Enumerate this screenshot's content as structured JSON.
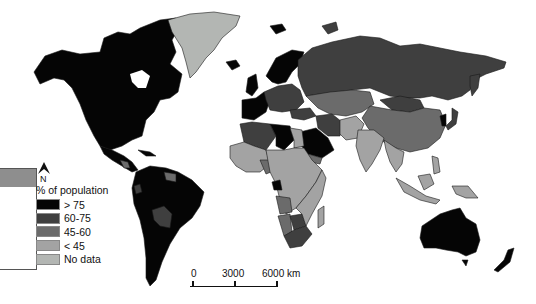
{
  "map": {
    "type": "world choropleth",
    "subject": "% of population"
  },
  "legend": {
    "title": "% of population",
    "items": [
      {
        "label": "> 75",
        "color": "#050505"
      },
      {
        "label": "60-75",
        "color": "#3f3f3f"
      },
      {
        "label": "45-60",
        "color": "#6b6b6b"
      },
      {
        "label": "< 45",
        "color": "#a3a3a3"
      },
      {
        "label": "No data",
        "color": "#b3b6b3"
      }
    ]
  },
  "north_arrow": {
    "label": "N"
  },
  "scale_bar": {
    "ticks": [
      "0",
      "3000",
      "6000 km"
    ]
  },
  "colors": {
    "ocean": "#ffffff",
    "border": "#1a1a1a",
    "side_box_header": "#8e8e8e"
  }
}
